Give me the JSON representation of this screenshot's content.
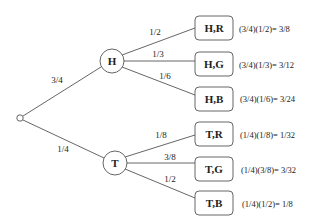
{
  "diagram": {
    "type": "probability-tree",
    "root": {
      "label": ""
    },
    "level1": [
      {
        "id": "H",
        "label": "H",
        "edge_label": "3/4"
      },
      {
        "id": "T",
        "label": "T",
        "edge_label": "1/4"
      }
    ],
    "outcomes": [
      {
        "label": "H,R",
        "edge_label": "1/2",
        "result": "(3/4)(1/2)= 3/8"
      },
      {
        "label": "H,G",
        "edge_label": "1/3",
        "result": "(3/4)(1/3)= 3/12"
      },
      {
        "label": "H,B",
        "edge_label": "1/6",
        "result": "(3/4)(1/6)= 3/24"
      },
      {
        "label": "T,R",
        "edge_label": "1/8",
        "result": "(1/4)(1/8)= 1/32"
      },
      {
        "label": "T,G",
        "edge_label": "3/8",
        "result": "(1/4)(3/8)= 3/32"
      },
      {
        "label": "T,B",
        "edge_label": "1/2",
        "result": "(1/4)(1/2)= 1/8"
      }
    ],
    "colors": {
      "stroke": "#555555",
      "text": "#222222",
      "background": "#ffffff"
    }
  }
}
